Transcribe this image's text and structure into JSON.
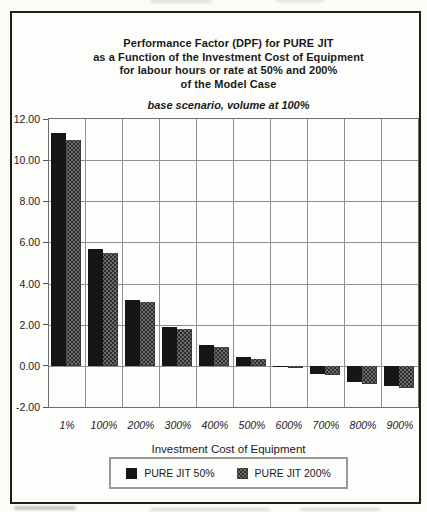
{
  "figure": {
    "title_lines": [
      "Performance Factor (DPF) for PURE JIT",
      "as a Function of the Investment Cost of Equipment",
      "for labour hours or rate at 50% and 200%",
      "of the Model Case"
    ],
    "subtitle": "base scenario, volume at 100%"
  },
  "chart_data": {
    "type": "bar",
    "title": "Performance Factor (DPF) for PURE JIT as a Function of the Investment Cost of Equipment for labour hours or rate at 50% and 200% of the Model Case",
    "subtitle": "base scenario, volume at 100%",
    "categories": [
      "1%",
      "100%",
      "200%",
      "300%",
      "400%",
      "500%",
      "600%",
      "700%",
      "800%",
      "900%"
    ],
    "series": [
      {
        "name": "PURE JIT 50%",
        "color": "#161616",
        "pattern": "solid-black",
        "values": [
          11.3,
          5.7,
          3.2,
          1.9,
          1.0,
          0.45,
          -0.05,
          -0.4,
          -0.8,
          -1.0
        ]
      },
      {
        "name": "PURE JIT 200%",
        "color": "#5c5c5c",
        "pattern": "halftone-gray",
        "values": [
          11.0,
          5.5,
          3.1,
          1.8,
          0.9,
          0.35,
          -0.1,
          -0.45,
          -0.9,
          -1.1
        ]
      }
    ],
    "xlabel_lines": [
      "Investment Cost of Equipment",
      "as a Percentage of Model Case"
    ],
    "ylabel": "",
    "ylim": [
      -2,
      12
    ],
    "ytick_step": 2,
    "ytick_labels": [
      "12.00",
      "10.00",
      "8.00",
      "6.00",
      "4.00",
      "2.00",
      "0.00",
      "-2.00"
    ],
    "grid": true,
    "legend_position": "bottom-center"
  }
}
